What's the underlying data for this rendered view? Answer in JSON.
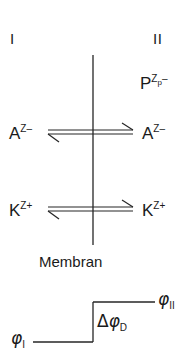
{
  "diagram": {
    "title_text": "Membran",
    "compartments": [
      {
        "id": "I",
        "label": "I"
      },
      {
        "id": "II",
        "label": "II"
      }
    ],
    "species": [
      {
        "name": "impermeant-anion",
        "base": "P",
        "superscript": "Z",
        "sub_superscript": "p",
        "charge_sign": "–",
        "side": "right",
        "crosses_membrane": false
      },
      {
        "name": "anion",
        "base": "A",
        "superscript": "Z",
        "charge_sign": "–",
        "side": "both",
        "crosses_membrane": true
      },
      {
        "name": "cation",
        "base": "K",
        "superscript": "Z",
        "charge_sign": "+",
        "side": "both",
        "crosses_membrane": true
      }
    ],
    "potentials": {
      "phi_left": {
        "symbol": "φ",
        "subscript": "I"
      },
      "phi_right": {
        "symbol": "φ",
        "subscript": "II"
      },
      "delta_phi": {
        "delta": "Δ",
        "symbol": "φ",
        "subscript": "D"
      }
    },
    "colors": {
      "ink": "#1a1a1a",
      "line": "#262626",
      "background": "#ffffff"
    }
  }
}
